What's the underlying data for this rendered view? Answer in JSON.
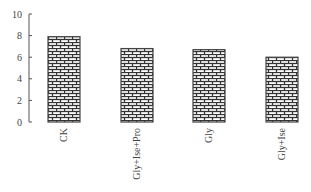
{
  "chart_data": {
    "type": "bar",
    "title": "",
    "xlabel": "",
    "ylabel": "",
    "categories": [
      "CK",
      "Gly+Ise+Pro",
      "Gly",
      "Gly+Ise"
    ],
    "values": [
      7.9,
      6.8,
      6.7,
      6.0
    ],
    "ylim": [
      0,
      10
    ],
    "yticks": [
      0,
      2,
      4,
      6,
      8,
      10
    ],
    "grid": false,
    "legend": null,
    "bar_pattern": "brick",
    "bar_color": "#333333",
    "bar_fill_color": "#ffffff"
  }
}
